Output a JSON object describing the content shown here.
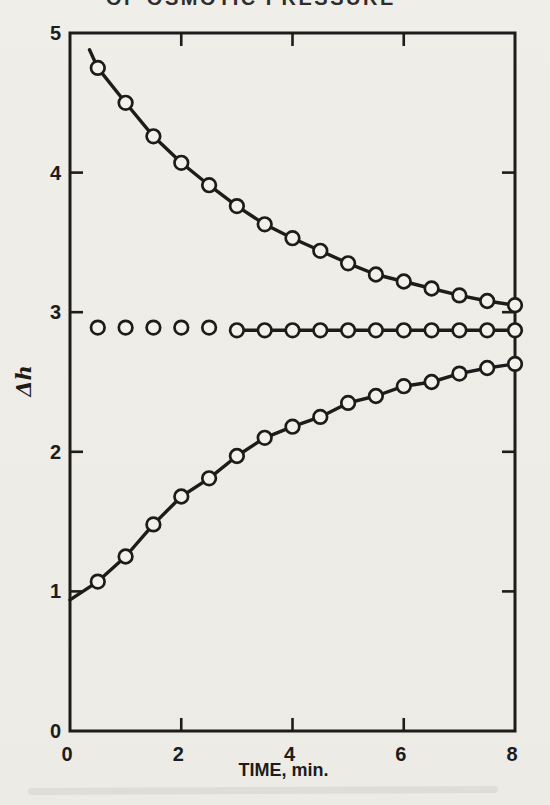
{
  "header": {
    "text": "OF OSMOTIC PRESSURE"
  },
  "colors": {
    "paper": "#efede8",
    "ink": "#1d1c1a",
    "marker_fill": "#f3f1ec"
  },
  "chart_data": {
    "type": "scatter",
    "title": "",
    "xlabel": "TIME, min.",
    "ylabel": "Δh",
    "xlim": [
      0,
      8
    ],
    "ylim": [
      0,
      5
    ],
    "xticks": [
      0,
      2,
      4,
      6,
      8
    ],
    "yticks": [
      0,
      1,
      2,
      3,
      4,
      5
    ],
    "grid": false,
    "legend": "none",
    "marker": "open-circle",
    "frame": "full-box-with-inner-ticks",
    "x": [
      0.5,
      1.0,
      1.5,
      2.0,
      2.5,
      3.0,
      3.5,
      4.0,
      4.5,
      5.0,
      5.5,
      6.0,
      6.5,
      7.0,
      7.5,
      8.0
    ],
    "series": [
      {
        "name": "upper-descending-curve",
        "values": [
          4.75,
          4.5,
          4.26,
          4.07,
          3.91,
          3.76,
          3.63,
          3.53,
          3.44,
          3.35,
          3.27,
          3.22,
          3.17,
          3.12,
          3.08,
          3.05
        ],
        "lead_point": [
          0.35,
          4.88
        ],
        "connected": true
      },
      {
        "name": "middle-equilibrium-line",
        "values": [
          2.89,
          2.89,
          2.89,
          2.89,
          2.89,
          2.87,
          2.87,
          2.87,
          2.87,
          2.87,
          2.87,
          2.87,
          2.87,
          2.87,
          2.87,
          2.87
        ],
        "line_start_index": 5,
        "connected": "partial"
      },
      {
        "name": "lower-ascending-curve",
        "values": [
          1.07,
          1.25,
          1.48,
          1.68,
          1.81,
          1.97,
          2.1,
          2.18,
          2.25,
          2.35,
          2.4,
          2.47,
          2.5,
          2.56,
          2.6,
          2.63
        ],
        "lead_point": [
          0.0,
          0.94
        ],
        "connected": true
      }
    ]
  }
}
